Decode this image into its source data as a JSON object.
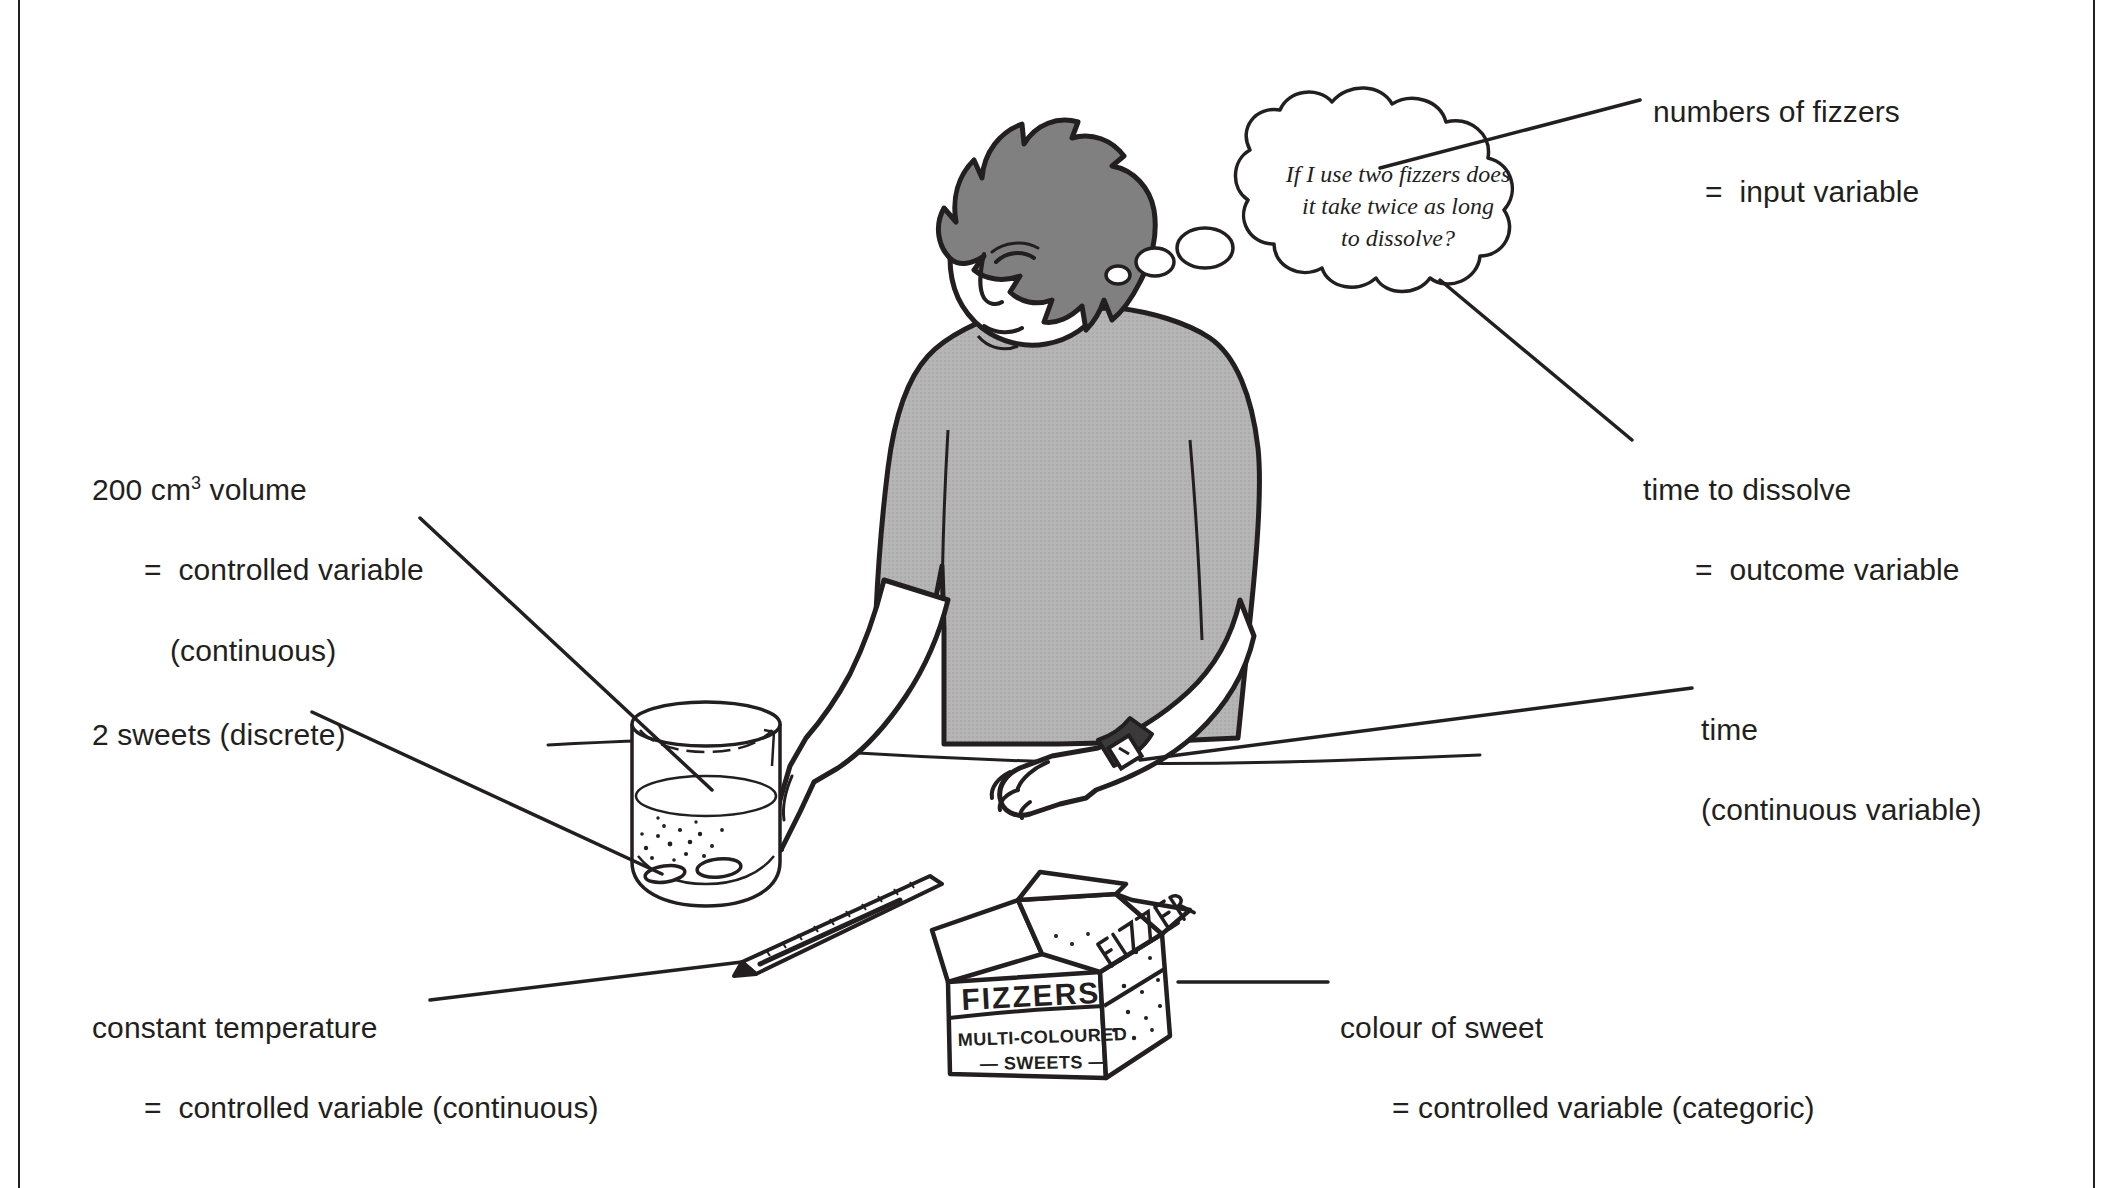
{
  "figure": {
    "kind": "science-diagram",
    "ink_color": "#231f20",
    "paper_color": "#ffffff",
    "shirt_color": "#b3b3b3",
    "hair_color": "#808080"
  },
  "thought_bubble": {
    "line1": "If I use two fizzers does",
    "line2": "it take twice as long",
    "line3": "to dissolve?"
  },
  "labels": {
    "numbers_of_fizzers": {
      "line1": "numbers of fizzers",
      "line2": "=  input variable"
    },
    "time_to_dissolve": {
      "line1": "time to dissolve",
      "line2": "=  outcome variable"
    },
    "time": {
      "line1": "time",
      "line2": "(continuous variable)"
    },
    "colour_of_sweet": {
      "line1": "colour of sweet",
      "line2": "= controlled variable (categoric)"
    },
    "volume": {
      "line1_a": "200 cm",
      "line1_sup": "3",
      "line1_b": " volume",
      "line2": "=  controlled variable",
      "line3": "(continuous)"
    },
    "sweets": {
      "line1": "2 sweets (discrete)"
    },
    "constant_temperature": {
      "line1": "constant temperature",
      "line2": "=  controlled variable (continuous)"
    }
  },
  "sweet_box": {
    "front_top": "FIZZERS",
    "front_mid": "MULTI-COLOURED",
    "front_bot": "— SWEETS —",
    "side": "FIZZER"
  },
  "scene_objects": [
    "boy-figure",
    "thought-bubble",
    "beaker-of-water",
    "two-fizzer-tablets",
    "thermometer",
    "wristwatch",
    "sweet-box",
    "table-edge"
  ]
}
